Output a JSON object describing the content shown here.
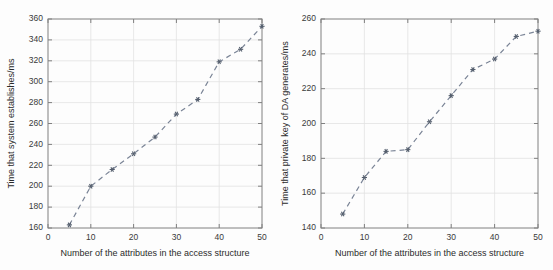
{
  "figure": {
    "background_color": "#fdfdfd",
    "line_color": "#7a8496",
    "marker_color": "#555f6e",
    "grid_color": "#e2e2e2",
    "axis_color": "#808080"
  },
  "chart_data": [
    {
      "type": "line",
      "title": "",
      "xlabel": "Number of the attributes in the access structure",
      "ylabel": "Time that system establishes/ms",
      "x": [
        5,
        10,
        15,
        20,
        25,
        30,
        35,
        40,
        45,
        50
      ],
      "values": [
        163,
        200,
        216,
        231,
        247,
        269,
        283,
        319,
        331,
        353
      ],
      "xlim": [
        0,
        50
      ],
      "ylim": [
        160,
        360
      ],
      "xticks": [
        0,
        10,
        20,
        30,
        40,
        50
      ],
      "yticks": [
        160,
        180,
        200,
        220,
        240,
        260,
        280,
        300,
        320,
        340,
        360
      ],
      "xtick_labels": [
        "0",
        "10",
        "20",
        "30",
        "40",
        "50"
      ],
      "ytick_labels": [
        "160",
        "180",
        "200",
        "220",
        "240",
        "260",
        "280",
        "300",
        "320",
        "340",
        "360"
      ],
      "grid": true,
      "legend": null,
      "linestyle": "dashed",
      "marker": "asterisk"
    },
    {
      "type": "line",
      "title": "",
      "xlabel": "Number of the attributes in the access structure",
      "ylabel": "Time that private key of DA generates/ms",
      "x": [
        5,
        10,
        15,
        20,
        25,
        30,
        35,
        40,
        45,
        50
      ],
      "values": [
        148,
        169,
        184,
        185,
        201,
        216,
        231,
        237,
        250,
        253
      ],
      "xlim": [
        0,
        50
      ],
      "ylim": [
        140,
        260
      ],
      "xticks": [
        0,
        10,
        20,
        30,
        40,
        50
      ],
      "yticks": [
        140,
        160,
        180,
        200,
        220,
        240,
        260
      ],
      "xtick_labels": [
        "0",
        "10",
        "20",
        "30",
        "40",
        "50"
      ],
      "ytick_labels": [
        "140",
        "160",
        "180",
        "200",
        "220",
        "240",
        "260"
      ],
      "grid": true,
      "legend": null,
      "linestyle": "dashed",
      "marker": "asterisk"
    }
  ]
}
